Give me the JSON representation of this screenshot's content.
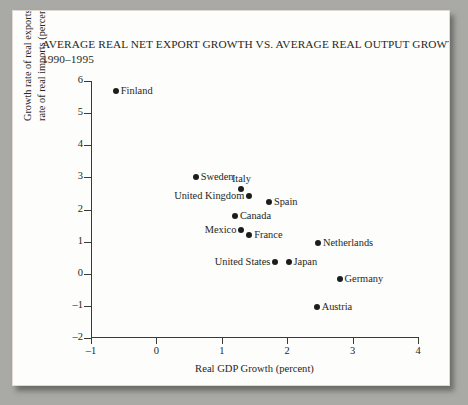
{
  "title": {
    "line1": "AVERAGE REAL NET EXPORT GROWTH VS. AVERAGE REAL OUTPUT GROWTH",
    "line2": "1990–1995"
  },
  "chart_data": {
    "type": "scatter",
    "title": "AVERAGE REAL NET EXPORT GROWTH VS. AVERAGE REAL OUTPUT GROWTH 1990–1995",
    "xlabel": "Real GDP Growth (percent)",
    "ylabel_line1": "Growth rate of real exports minus growth",
    "ylabel_line2": "rate of real imports (percent)",
    "xlim": [
      -1,
      4
    ],
    "ylim": [
      -2,
      6
    ],
    "xticks": [
      "-1",
      "0",
      "1",
      "2",
      "3",
      "4"
    ],
    "xtick_values": [
      -1,
      0,
      1,
      2,
      3,
      4
    ],
    "yticks": [
      "-2",
      "-1",
      "0",
      "1",
      "2",
      "3",
      "4",
      "5",
      "6"
    ],
    "ytick_values": [
      -2,
      -1,
      0,
      1,
      2,
      3,
      4,
      5,
      6
    ],
    "grid": false,
    "legend": "none",
    "points": [
      {
        "label": "Finland",
        "x": -0.62,
        "y": 5.7,
        "label_pos": "right"
      },
      {
        "label": "Sweden",
        "x": 0.6,
        "y": 3.02,
        "label_pos": "right"
      },
      {
        "label": "Italy",
        "x": 1.3,
        "y": 2.65,
        "label_pos": "above"
      },
      {
        "label": "United Kingdom",
        "x": 1.42,
        "y": 2.42,
        "label_pos": "left"
      },
      {
        "label": "Spain",
        "x": 1.72,
        "y": 2.22,
        "label_pos": "right"
      },
      {
        "label": "Canada",
        "x": 1.2,
        "y": 1.8,
        "label_pos": "right"
      },
      {
        "label": "Mexico",
        "x": 1.3,
        "y": 1.37,
        "label_pos": "left"
      },
      {
        "label": "France",
        "x": 1.42,
        "y": 1.22,
        "label_pos": "right"
      },
      {
        "label": "Netherlands",
        "x": 2.47,
        "y": 0.95,
        "label_pos": "right"
      },
      {
        "label": "United States",
        "x": 1.82,
        "y": 0.38,
        "label_pos": "left"
      },
      {
        "label": "Japan",
        "x": 2.02,
        "y": 0.38,
        "label_pos": "right"
      },
      {
        "label": "Germany",
        "x": 2.8,
        "y": -0.15,
        "label_pos": "right"
      },
      {
        "label": "Austria",
        "x": 2.45,
        "y": -1.05,
        "label_pos": "right"
      }
    ]
  }
}
